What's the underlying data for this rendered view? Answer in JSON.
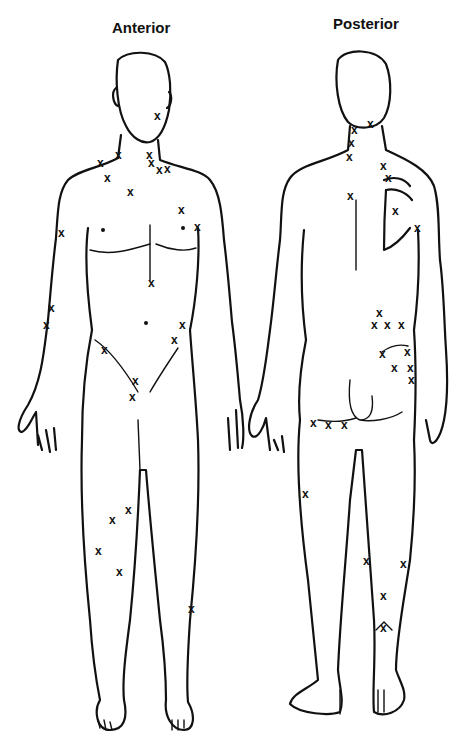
{
  "labels": {
    "anterior": "Anterior",
    "posterior": "Posterior"
  },
  "marker_glyph": "x",
  "colors": {
    "ink": "#111111",
    "background": "#ffffff"
  },
  "anterior_points": [
    [
      158,
      116
    ],
    [
      101,
      163
    ],
    [
      119,
      155
    ],
    [
      108,
      178
    ],
    [
      150,
      155
    ],
    [
      152,
      163
    ],
    [
      160,
      170
    ],
    [
      168,
      169
    ],
    [
      131,
      192
    ],
    [
      182,
      210
    ],
    [
      198,
      227
    ],
    [
      62,
      233
    ],
    [
      152,
      283
    ],
    [
      52,
      308
    ],
    [
      47,
      325
    ],
    [
      105,
      350
    ],
    [
      183,
      325
    ],
    [
      175,
      340
    ],
    [
      136,
      381
    ],
    [
      133,
      397
    ],
    [
      129,
      510
    ],
    [
      113,
      520
    ],
    [
      99,
      551
    ],
    [
      120,
      572
    ],
    [
      192,
      609
    ]
  ],
  "posterior_points": [
    [
      355,
      130
    ],
    [
      371,
      124
    ],
    [
      352,
      143
    ],
    [
      350,
      157
    ],
    [
      384,
      166
    ],
    [
      389,
      178
    ],
    [
      351,
      196
    ],
    [
      396,
      211
    ],
    [
      418,
      228
    ],
    [
      380,
      313
    ],
    [
      375,
      325
    ],
    [
      388,
      325
    ],
    [
      402,
      325
    ],
    [
      383,
      354
    ],
    [
      408,
      352
    ],
    [
      395,
      368
    ],
    [
      411,
      368
    ],
    [
      412,
      380
    ],
    [
      314,
      423
    ],
    [
      329,
      425
    ],
    [
      345,
      425
    ],
    [
      306,
      494
    ],
    [
      367,
      561
    ],
    [
      404,
      564
    ],
    [
      384,
      596
    ],
    [
      384,
      628
    ]
  ]
}
